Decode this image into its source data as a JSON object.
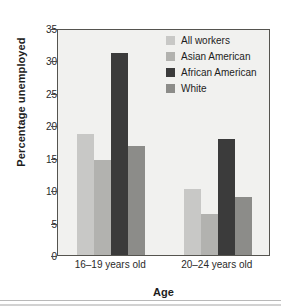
{
  "chart_data": {
    "type": "bar",
    "title": "",
    "xlabel": "Age",
    "ylabel": "Percentage unemployed",
    "categories": [
      "16–19 years old",
      "20–24 years old"
    ],
    "series": [
      {
        "name": "All workers",
        "color": "#c8c8c6",
        "values": [
          18.7,
          10.2
        ]
      },
      {
        "name": "Asian American",
        "color": "#b2b2af",
        "values": [
          14.6,
          6.3
        ]
      },
      {
        "name": "African American",
        "color": "#3b3b3b",
        "values": [
          31.2,
          17.9
        ]
      },
      {
        "name": "White",
        "color": "#8c8c89",
        "values": [
          16.8,
          9.0
        ]
      }
    ],
    "ylim": [
      0,
      35
    ],
    "yticks": [
      0,
      5,
      10,
      15,
      20,
      25,
      30,
      35
    ],
    "ytick_labels": [
      "0",
      "5",
      "10",
      "15",
      "20",
      "25",
      "30",
      "35"
    ],
    "grid": false,
    "legend_position": "top-right-inside",
    "plot_background": "#f1f1ef",
    "frame_color": "#55544f",
    "axis_text_color": "#2a2a2a"
  }
}
